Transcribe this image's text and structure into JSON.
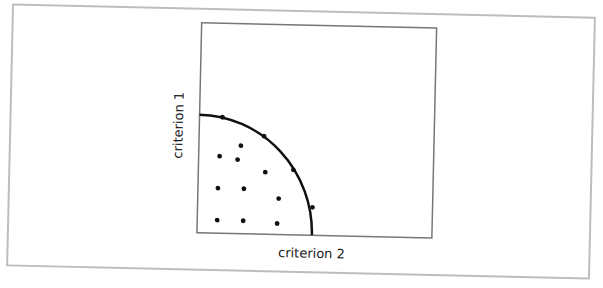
{
  "chart_data": {
    "type": "scatter",
    "title": "",
    "xlabel": "criterion 2",
    "ylabel": "criterion 1",
    "grid": false,
    "legend": null,
    "annotations": [
      "quarter-circle frontier curve through outer points"
    ],
    "points_px": [
      {
        "x": 224,
        "y": 117,
        "on_frontier": true
      },
      {
        "x": 266,
        "y": 135,
        "on_frontier": true
      },
      {
        "x": 296,
        "y": 168,
        "on_frontier": true
      },
      {
        "x": 316,
        "y": 205,
        "on_frontier": true
      },
      {
        "x": 243,
        "y": 145,
        "on_frontier": false
      },
      {
        "x": 222,
        "y": 156,
        "on_frontier": false
      },
      {
        "x": 240,
        "y": 159,
        "on_frontier": false
      },
      {
        "x": 268,
        "y": 171,
        "on_frontier": false
      },
      {
        "x": 221,
        "y": 188,
        "on_frontier": false
      },
      {
        "x": 247,
        "y": 188,
        "on_frontier": false
      },
      {
        "x": 282,
        "y": 197,
        "on_frontier": false
      },
      {
        "x": 221,
        "y": 220,
        "on_frontier": false
      },
      {
        "x": 247,
        "y": 220,
        "on_frontier": false
      },
      {
        "x": 281,
        "y": 222,
        "on_frontier": false
      }
    ]
  },
  "labels": {
    "x_axis": "criterion 2",
    "y_axis": "criterion 1"
  },
  "colors": {
    "frame": "#bdbdbd",
    "plot_box": "#777777",
    "ink": "#111111"
  }
}
